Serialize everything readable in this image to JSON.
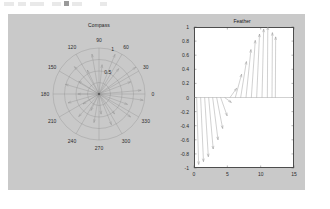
{
  "figure": {
    "background_color": "#c9c9c9",
    "page_background_color": "#ffffff",
    "axes_background_color": "#ffffff",
    "line_color": "#808080",
    "text_color": "#2b2b2b"
  },
  "compass": {
    "title": "Compass",
    "angle_labels": [
      "0",
      "30",
      "60",
      "90",
      "120",
      "150",
      "180",
      "210",
      "240",
      "270",
      "300",
      "330"
    ],
    "angle_values": [
      0,
      30,
      60,
      90,
      120,
      150,
      180,
      210,
      240,
      270,
      300,
      330
    ],
    "radial_labels": [
      "0.5",
      "1"
    ],
    "radial_values": [
      0.5,
      1
    ]
  },
  "feather": {
    "title": "Feather",
    "ytick_labels": [
      "1",
      "0.8",
      "0.6",
      "0.4",
      "0.2",
      "0",
      "-0.2",
      "-0.4",
      "-0.6",
      "-0.8",
      "-1"
    ],
    "ytick_values": [
      1,
      0.8,
      0.6,
      0.4,
      0.2,
      0,
      -0.2,
      -0.4,
      -0.6,
      -0.8,
      -1
    ],
    "xtick_labels": [
      "0",
      "5",
      "10",
      "15"
    ],
    "xtick_values": [
      0,
      5,
      10,
      15
    ]
  },
  "chart_data": [
    {
      "type": "scatter",
      "name": "compass-plot",
      "title": "Compass",
      "plot_style": "compass",
      "xlabel": "",
      "ylabel": "",
      "theta_unit": "degrees",
      "rlim": [
        0,
        1
      ],
      "rticks": [
        0.5,
        1
      ],
      "rtick_labels": [
        "0.5",
        "1"
      ],
      "theta_ticks": [
        0,
        30,
        60,
        90,
        120,
        150,
        180,
        210,
        240,
        270,
        300,
        330
      ],
      "theta_tick_labels": [
        "0",
        "30",
        "60",
        "90",
        "120",
        "150",
        "180",
        "210",
        "240",
        "270",
        "300",
        "330"
      ],
      "grid": true,
      "legend": "none",
      "vectors": [
        {
          "theta": 5,
          "r": 0.92
        },
        {
          "theta": 21,
          "r": 0.74
        },
        {
          "theta": 36,
          "r": 0.99
        },
        {
          "theta": 52,
          "r": 0.7
        },
        {
          "theta": 68,
          "r": 0.93
        },
        {
          "theta": 84,
          "r": 0.64
        },
        {
          "theta": 100,
          "r": 0.88
        },
        {
          "theta": 116,
          "r": 0.58
        },
        {
          "theta": 132,
          "r": 0.8
        },
        {
          "theta": 148,
          "r": 0.52
        },
        {
          "theta": 164,
          "r": 0.76
        },
        {
          "theta": 180,
          "r": 0.46
        },
        {
          "theta": 196,
          "r": 0.7
        },
        {
          "theta": 212,
          "r": 0.41
        },
        {
          "theta": 228,
          "r": 0.66
        },
        {
          "theta": 244,
          "r": 0.4
        },
        {
          "theta": 260,
          "r": 0.63
        },
        {
          "theta": 276,
          "r": 0.44
        },
        {
          "theta": 292,
          "r": 0.72
        },
        {
          "theta": 308,
          "r": 0.55
        },
        {
          "theta": 324,
          "r": 0.85
        },
        {
          "theta": 340,
          "r": 0.66
        },
        {
          "theta": 352,
          "r": 0.97
        }
      ]
    },
    {
      "type": "scatter",
      "name": "feather-plot",
      "title": "Feather",
      "plot_style": "feather",
      "xlabel": "",
      "ylabel": "",
      "xlim": [
        0,
        15
      ],
      "ylim": [
        -1,
        1
      ],
      "xticks": [
        0,
        5,
        10,
        15
      ],
      "yticks": [
        1,
        0.8,
        0.6,
        0.4,
        0.2,
        0,
        -0.2,
        -0.4,
        -0.6,
        -0.8,
        -1
      ],
      "grid": false,
      "legend": "none",
      "baseline_y": 0,
      "arrows": [
        {
          "x0": 0.4,
          "u": 0.3,
          "v": -0.95
        },
        {
          "x0": 1.0,
          "u": 0.42,
          "v": -0.91
        },
        {
          "x0": 1.6,
          "u": 0.55,
          "v": -0.84
        },
        {
          "x0": 2.2,
          "u": 0.68,
          "v": -0.73
        },
        {
          "x0": 2.8,
          "u": 0.8,
          "v": -0.6
        },
        {
          "x0": 3.4,
          "u": 0.9,
          "v": -0.44
        },
        {
          "x0": 4.0,
          "u": 0.97,
          "v": -0.26
        },
        {
          "x0": 4.6,
          "u": 1.0,
          "v": -0.07
        },
        {
          "x0": 5.4,
          "u": 0.99,
          "v": 0.13
        },
        {
          "x0": 6.2,
          "u": 0.94,
          "v": 0.33
        },
        {
          "x0": 7.0,
          "u": 0.86,
          "v": 0.51
        },
        {
          "x0": 7.8,
          "u": 0.74,
          "v": 0.68
        },
        {
          "x0": 8.6,
          "u": 0.59,
          "v": 0.81
        },
        {
          "x0": 9.4,
          "u": 0.43,
          "v": 0.9
        },
        {
          "x0": 10.2,
          "u": 0.25,
          "v": 0.97
        },
        {
          "x0": 11.0,
          "u": 0.07,
          "v": 1.0
        },
        {
          "x0": 11.7,
          "u": 0.06,
          "v": 0.92
        },
        {
          "x0": 12.2,
          "u": 0.05,
          "v": 0.86
        }
      ]
    }
  ]
}
